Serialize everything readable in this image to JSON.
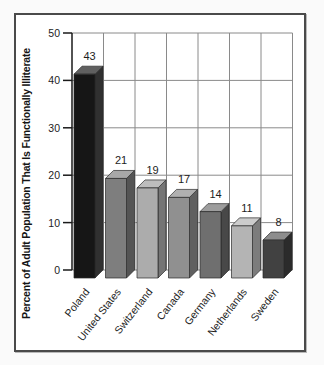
{
  "chart_data": {
    "type": "bar",
    "style": "3d-bars",
    "title": "",
    "xlabel": "",
    "ylabel": "Percent of Adult Population That Is Functionally Illiterate",
    "categories": [
      "Poland",
      "United States",
      "Switzerland",
      "Canada",
      "Germany",
      "Netherlands",
      "Sweden"
    ],
    "values": [
      43,
      21,
      19,
      17,
      14,
      11,
      8
    ],
    "value_labels": [
      "43",
      "21",
      "19",
      "17",
      "14",
      "11",
      "8"
    ],
    "yticks": [
      0,
      10,
      20,
      30,
      40,
      50
    ],
    "ylim": [
      0,
      50
    ],
    "grid": true,
    "legend": "none",
    "colors": {
      "bars": [
        {
          "name": "poland",
          "front": "#161616",
          "side": "#303030",
          "top": "#606060"
        },
        {
          "name": "united-states",
          "front": "#7e7e7e",
          "side": "#545454",
          "top": "#a8a8a8"
        },
        {
          "name": "switzerland",
          "front": "#acacac",
          "side": "#757575",
          "top": "#bdbdbd"
        },
        {
          "name": "canada",
          "front": "#909090",
          "side": "#606060",
          "top": "#b0b0b0"
        },
        {
          "name": "germany",
          "front": "#6f6f6f",
          "side": "#484848",
          "top": "#9d9d9d"
        },
        {
          "name": "netherlands",
          "front": "#b4b4b4",
          "side": "#7c7c7c",
          "top": "#cccccc"
        },
        {
          "name": "sweden",
          "front": "#414141",
          "side": "#2b2b2b",
          "top": "#8d8d8d"
        }
      ],
      "gridline": "#8a8a8a",
      "axis": "#1a1a1a",
      "frame_border": "#4a4a4a",
      "text": "#1d1d1d"
    }
  }
}
